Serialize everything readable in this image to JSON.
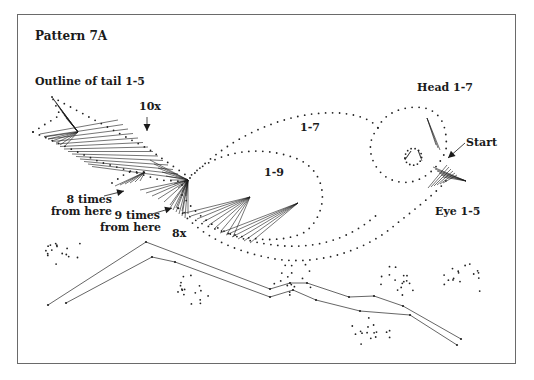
{
  "title": "Pattern 7A",
  "labels": {
    "tail_outline": "Outline of tail 1-5",
    "ten_x": "10x",
    "body_upper": "1-7",
    "body_inner": "1-9",
    "head": "Head 1-7",
    "start": "Start",
    "eye": "Eye 1-5",
    "eight_times_l1": "8 times",
    "eight_times_l2": "from here",
    "nine_times_l1": "9 times",
    "nine_times_l2": "from here",
    "eight_x": "8x"
  },
  "colors": {
    "frame": "#6a6a6a",
    "dots": "#222222",
    "thread": "#1a1a1a",
    "text": "#1a1a1a"
  },
  "dotted_paths": [
    {
      "name": "tail-upper-feather",
      "d": "M52,97 L150,150 L190,178",
      "spacing": 7
    },
    {
      "name": "tail-lower-edge",
      "d": "M33,132 L60,115 L52,97",
      "spacing": 7
    },
    {
      "name": "tail-bottom-edge",
      "d": "M33,132 L100,162 L160,180 L190,182",
      "spacing": 7
    },
    {
      "name": "tail-small-feather",
      "d": "M112,183 L128,172 L145,172",
      "spacing": 7
    },
    {
      "name": "body-top",
      "d": "M190,178 C230,135 290,110 340,113 C360,115 372,120 378,128",
      "spacing": 7
    },
    {
      "name": "body-inner-wing",
      "d": "M182,185 C210,150 260,143 300,160 C330,175 328,215 305,232 C280,245 240,240 205,225 C190,218 180,210 175,205",
      "spacing": 7
    },
    {
      "name": "body-belly",
      "d": "M178,208 C200,235 230,250 270,258 C310,266 360,255 395,225 C420,205 440,190 448,178",
      "spacing": 7
    },
    {
      "name": "body-belly-inner",
      "d": "M182,195 C205,228 240,243 285,246 C325,248 355,235 380,212",
      "spacing": 7
    },
    {
      "name": "head-circle",
      "d": "M378,128 C385,110 410,105 425,108 C440,112 448,125 446,150 C440,166 425,180 410,182 C392,184 378,175 372,158 C368,145 372,135 378,128",
      "spacing": 7
    },
    {
      "name": "eye",
      "d": "M405,158 C405,150 412,146 418,150 C424,154 422,162 416,165 C410,166 405,163 405,158",
      "spacing": 4
    }
  ],
  "branch": {
    "upper": [
      [
        48,
        305
      ],
      [
        146,
        242
      ],
      [
        270,
        289
      ],
      [
        290,
        283
      ],
      [
        307,
        283
      ],
      [
        349,
        297
      ],
      [
        374,
        296
      ],
      [
        403,
        306
      ],
      [
        461,
        339
      ]
    ],
    "lower": [
      [
        66,
        303
      ],
      [
        152,
        257
      ],
      [
        175,
        262
      ],
      [
        270,
        297
      ],
      [
        293,
        290
      ],
      [
        316,
        300
      ],
      [
        360,
        311
      ],
      [
        410,
        315
      ],
      [
        457,
        345
      ]
    ]
  },
  "flower_clusters": [
    {
      "name": "flower-left",
      "cx": 60,
      "cy": 250
    },
    {
      "name": "flower-under-branch",
      "cx": 190,
      "cy": 288
    },
    {
      "name": "flower-mid",
      "cx": 292,
      "cy": 278
    },
    {
      "name": "flower-right",
      "cx": 400,
      "cy": 280
    },
    {
      "name": "flower-bottom",
      "cx": 372,
      "cy": 330
    },
    {
      "name": "sprig-right",
      "cx": 465,
      "cy": 280
    }
  ]
}
